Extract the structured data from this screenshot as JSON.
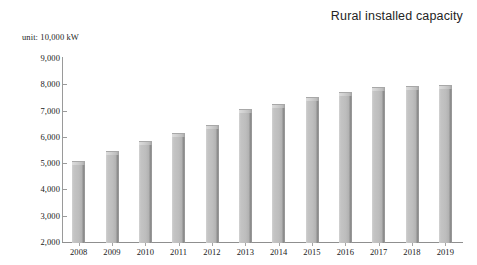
{
  "chart_data": {
    "type": "bar",
    "title": "Rural installed capacity",
    "subtitle": "unit: 10,000 kW",
    "xlabel": "",
    "ylabel": "",
    "ylim": [
      2000,
      9000
    ],
    "y_tick_step": 1000,
    "grid": false,
    "legend": "none",
    "categories": [
      "2008",
      "2009",
      "2010",
      "2011",
      "2012",
      "2013",
      "2014",
      "2015",
      "2016",
      "2017",
      "2018",
      "2019"
    ],
    "values": [
      5100,
      5450,
      5850,
      6150,
      6450,
      7050,
      7250,
      7500,
      7700,
      7900,
      7950,
      7980
    ],
    "y_tick_labels": [
      "9,000",
      "8,000",
      "7,000",
      "6,000",
      "5,000",
      "4,000",
      "3,000",
      "2,000"
    ],
    "y_tick_values": [
      9000,
      8000,
      7000,
      6000,
      5000,
      4000,
      3000,
      2000
    ],
    "bar_color": "#bdbdbd",
    "bar_edge_color": "#8c8c8c",
    "axis_color": "#9a9a9a",
    "text_color": "#202020"
  }
}
